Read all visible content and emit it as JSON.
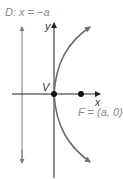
{
  "figure": {
    "directrix_label": "D: x = −a",
    "y_axis_label": "y",
    "x_axis_label": "x",
    "vertex_label": "V",
    "focus_label": "F = (a, 0)"
  },
  "colors": {
    "axis": "#222222",
    "curve": "#6e6e6e",
    "directrix": "#7a7a7a",
    "label_gray": "#8a8a8a",
    "label_dark": "#333333",
    "point": "#111111"
  }
}
